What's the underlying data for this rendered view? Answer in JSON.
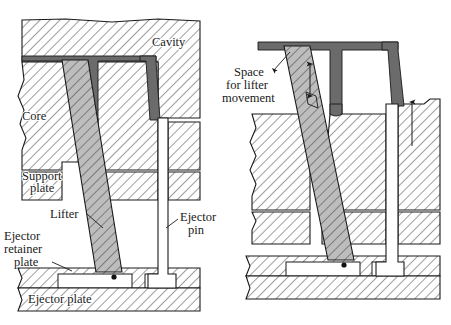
{
  "figure": {
    "background_color": "#ffffff",
    "line_color": "#1a1a1a",
    "part_color": "#6b6b6b",
    "lifter_fill": "#b8b8b8",
    "steel_fill": "#ffffff",
    "pin_fill": "#ffffff"
  },
  "views": [
    {
      "name": "closed-position-view",
      "position": "left",
      "description": "Mold closed with lifter in molding position"
    },
    {
      "name": "ejection-position-view",
      "position": "right",
      "description": "Mold open with lifter and ejector pin advanced"
    }
  ],
  "labels": {
    "cavity": "Cavity",
    "core": "Core",
    "support_plate_line1": "Support",
    "support_plate_line2": "plate",
    "lifter": "Lifter",
    "ejector_pin_line1": "Ejector",
    "ejector_pin_line2": "pin",
    "ejector_retainer_line1": "Ejector",
    "ejector_retainer_line2": "retainer",
    "ejector_retainer_line3": "plate",
    "ejector_plate": "Ejector plate",
    "space_line1": "Space",
    "space_line2": "for lifter",
    "space_line3": "movement"
  },
  "annotations": {
    "lifter_movement_arrow": "double-headed-vertical-arrow",
    "ejection_direction_arrow": "up-arrow"
  }
}
